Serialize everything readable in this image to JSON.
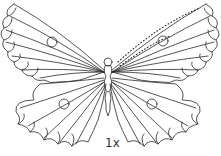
{
  "illustration": {
    "subject": "butterfly line art",
    "stroke_color": "#2a2a2a",
    "background": "#ffffff"
  },
  "scale_label": "1x"
}
